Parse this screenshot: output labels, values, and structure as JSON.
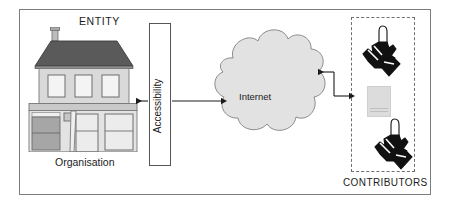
{
  "diagram": {
    "type": "block-flow-diagram",
    "frame": {
      "border_color": "#7c7c7c",
      "background": "#ffffff"
    }
  },
  "labels": {
    "entity": "ENTITY",
    "organisation": "Organisation",
    "accessibility": "Accessibility",
    "internet": "Internet",
    "contributors": "CONTRIBUTORS"
  },
  "nodes": [
    {
      "id": "entity-building",
      "name": "organisation-building",
      "label": "ENTITY",
      "sublabel": "Organisation",
      "icon": "building-icon",
      "roof_color": "#5a5a5a",
      "wall_color": "#d9d9d9",
      "window_color": "#f2f2f2"
    },
    {
      "id": "accessibility",
      "name": "accessibility-box",
      "label": "Accessibility",
      "shape": "tall-rectangle",
      "fill": "#ffffff",
      "stroke": "#555555"
    },
    {
      "id": "internet",
      "name": "internet-cloud",
      "label": "Internet",
      "shape": "cloud",
      "fill": "#e2e2e2",
      "stroke": "#8a8a8a"
    },
    {
      "id": "contributors",
      "name": "contributors-group",
      "label": "CONTRIBUTORS",
      "shape": "dashed-rectangle",
      "stroke": "#6f6f6f",
      "items": [
        "contributor-hand-icon",
        "document-icon",
        "contributor-hand-icon"
      ]
    }
  ],
  "connectors": [
    {
      "name": "accessibility-to-entity-arrow",
      "from": "accessibility",
      "to": "entity-building",
      "direction": "left",
      "style": "solid"
    },
    {
      "name": "accessibility-to-internet-arrow",
      "from": "accessibility",
      "to": "internet",
      "direction": "right",
      "style": "solid"
    },
    {
      "name": "contributors-to-internet-arrow",
      "from": "contributors",
      "to": "internet",
      "direction": "left",
      "style": "solid-elbow"
    },
    {
      "name": "internet-to-contributors-arrow",
      "from": "internet",
      "to": "contributors",
      "direction": "right",
      "style": "solid-elbow"
    }
  ],
  "colors": {
    "frame_border": "#7c7c7c",
    "cloud_fill": "#e2e2e2",
    "cloud_stroke": "#8a8a8a",
    "roof": "#5a5a5a",
    "wall": "#d9d9d9",
    "ink": "#1c1c1c",
    "dashed": "#6f6f6f"
  }
}
